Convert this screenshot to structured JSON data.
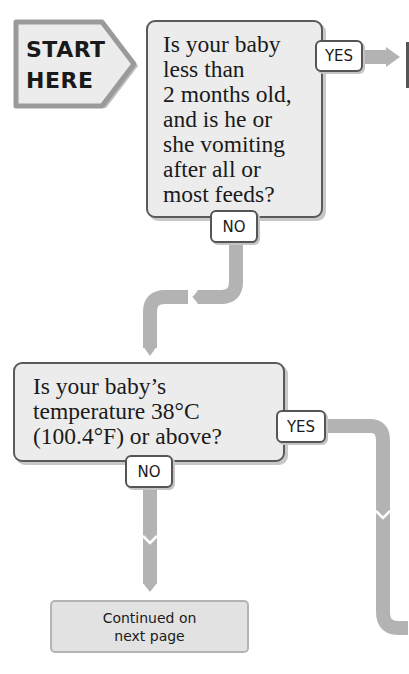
{
  "start": {
    "line1": "START",
    "line2": "HERE"
  },
  "questions": [
    {
      "lines": [
        "Is your baby",
        "less than",
        "2 months old,",
        "and is he or",
        "she vomiting",
        "after all or",
        "most feeds?"
      ],
      "yes_label": "YES",
      "no_label": "NO"
    },
    {
      "lines": [
        "Is your baby’s",
        "temperature 38°C",
        "(100.4°F) or above?"
      ],
      "yes_label": "YES",
      "no_label": "NO"
    }
  ],
  "continued": {
    "line1": "Continued on",
    "line2": "next page"
  },
  "colors": {
    "connector": "#b3b3b3",
    "box_fill": "#ececec",
    "box_border": "#5a5a5a",
    "continued_fill": "#e2e2e2"
  },
  "icons": [
    "start-arrow-icon",
    "right-arrow-icon",
    "chevron-down-icon"
  ]
}
